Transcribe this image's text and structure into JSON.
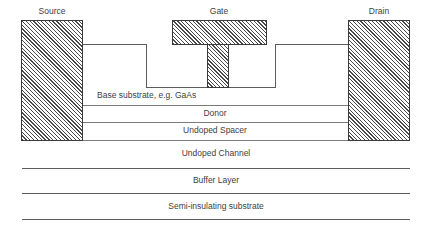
{
  "diagram": {
    "terminals": [
      {
        "name": "source",
        "label": "Source"
      },
      {
        "name": "gate",
        "label": "Gate"
      },
      {
        "name": "drain",
        "label": "Drain"
      }
    ],
    "layers": [
      {
        "name": "base-substrate",
        "label": "Base substrate, e.g. GaAs",
        "align": "left"
      },
      {
        "name": "donor",
        "label": "Donor",
        "align": "center"
      },
      {
        "name": "undoped-spacer",
        "label": "Undoped Spacer",
        "align": "center"
      },
      {
        "name": "undoped-channel",
        "label": "Undoped Channel",
        "align": "center"
      },
      {
        "name": "buffer-layer",
        "label": "Buffer Layer",
        "align": "center"
      },
      {
        "name": "semi-insulating-substrate",
        "label": "Semi-insulating substrate",
        "align": "center"
      }
    ],
    "colors": {
      "hatch_line": "#4a4a4a",
      "outline": "#3a3a3a",
      "layer_divider": "#7c7c7c",
      "text": "#404040",
      "background": "#ffffff"
    }
  }
}
